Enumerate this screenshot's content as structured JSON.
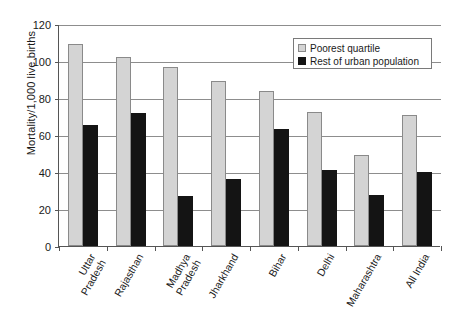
{
  "chart_data": {
    "type": "bar",
    "title": "",
    "subtitle": "",
    "xlabel": "",
    "ylabel": "Mortality/1,000 live births",
    "ylim": [
      0,
      120
    ],
    "yticks": [
      0,
      20,
      40,
      60,
      80,
      100,
      120
    ],
    "ytick_labels": [
      "0",
      "20",
      "40",
      "60",
      "80",
      "100",
      "120"
    ],
    "grid": true,
    "legend_position": "top-right",
    "categories": [
      "Uttar Pradesh",
      "Rajasthan",
      "Madhya Pradesh",
      "Jharkhand",
      "Bihar",
      "Delhi",
      "Maharashtra",
      "All India"
    ],
    "category_lines": [
      [
        "Uttar",
        "Pradesh"
      ],
      [
        "Rajasthan"
      ],
      [
        "Madhya",
        "Pradesh"
      ],
      [
        "Jharkhand"
      ],
      [
        "Bihar"
      ],
      [
        "Delhi"
      ],
      [
        "Maharashtra"
      ],
      [
        "All India"
      ]
    ],
    "series": [
      {
        "name": "Poorest quartile",
        "color": "#d4d4d4",
        "values": [
          109,
          102,
          97,
          89,
          84,
          72.5,
          49,
          71
        ]
      },
      {
        "name": "Rest of urban population",
        "color": "#141414",
        "values": [
          65.5,
          72,
          27,
          36,
          63.5,
          41,
          27.5,
          40
        ]
      }
    ]
  },
  "legend": {
    "items": [
      {
        "label": "Poorest quartile",
        "swatch": "light-gray-square"
      },
      {
        "label": "Rest of urban population",
        "swatch": "black-square"
      }
    ]
  }
}
